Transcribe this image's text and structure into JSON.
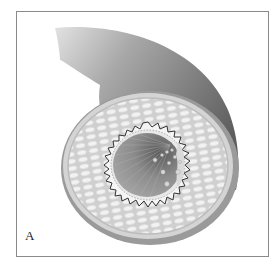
{
  "figure": {
    "panel_label": "A",
    "colors": {
      "tube_dark": "#6e6e6e",
      "tube_light": "#d6d6d6",
      "media_fill": "#e4e4e4",
      "lumen": "#8a8a8a",
      "frame": "#8a8a8a"
    },
    "layers": [
      "tunica-externa",
      "tunica-media",
      "internal-elastic-lamina",
      "endothelium",
      "lumen"
    ]
  }
}
